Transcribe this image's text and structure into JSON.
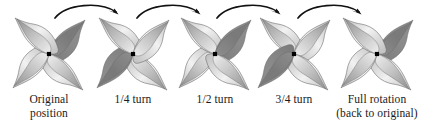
{
  "figure": {
    "background": "#ffffff",
    "width": 427,
    "height": 131
  },
  "colors": {
    "ink": "#1a1a1a",
    "arrow": "#111111",
    "blade_light": "#f2f2f2",
    "blade_mid": "#bdbdbd",
    "blade_dark": "#8f8f8f",
    "blade_shadow": "#7a7a7a",
    "highlight_blade": "#8a8a8a",
    "outline": "#6b6b6b",
    "hub": "#000000"
  },
  "steps": [
    {
      "id": "step-original",
      "name": "original-position",
      "x": 6,
      "rotation_deg": 0,
      "rotation_label": "0",
      "highlight_blade_index": 0,
      "caption_line1": "Original",
      "caption_line2": "position"
    },
    {
      "id": "step-quarter",
      "name": "quarter-turn",
      "x": 90,
      "rotation_deg": 90,
      "rotation_label": "1/4",
      "highlight_blade_index": 1,
      "caption_line1": "1/4 turn",
      "caption_line2": ""
    },
    {
      "id": "step-half",
      "name": "half-turn",
      "x": 172,
      "rotation_deg": 180,
      "rotation_label": "1/2",
      "highlight_blade_index": 2,
      "caption_line1": "1/2 turn",
      "caption_line2": ""
    },
    {
      "id": "step-three-quarter",
      "name": "three-quarter-turn",
      "x": 251,
      "rotation_deg": 270,
      "rotation_label": "3/4",
      "highlight_blade_index": 3,
      "caption_line1": "3/4 turn",
      "caption_line2": ""
    },
    {
      "id": "step-full",
      "name": "full-rotation",
      "x": 334,
      "rotation_deg": 360,
      "rotation_label": "1",
      "highlight_blade_index": 0,
      "caption_line1": "Full rotation",
      "caption_line2": "(back to original)"
    }
  ],
  "arrows": [
    {
      "id": "arrow-1",
      "name": "rotation-arrow-1",
      "x": 52,
      "direction": "clockwise"
    },
    {
      "id": "arrow-2",
      "name": "rotation-arrow-2",
      "x": 134,
      "direction": "clockwise"
    },
    {
      "id": "arrow-3",
      "name": "rotation-arrow-3",
      "x": 214,
      "direction": "clockwise"
    },
    {
      "id": "arrow-4",
      "name": "rotation-arrow-4",
      "x": 295,
      "direction": "clockwise"
    }
  ]
}
